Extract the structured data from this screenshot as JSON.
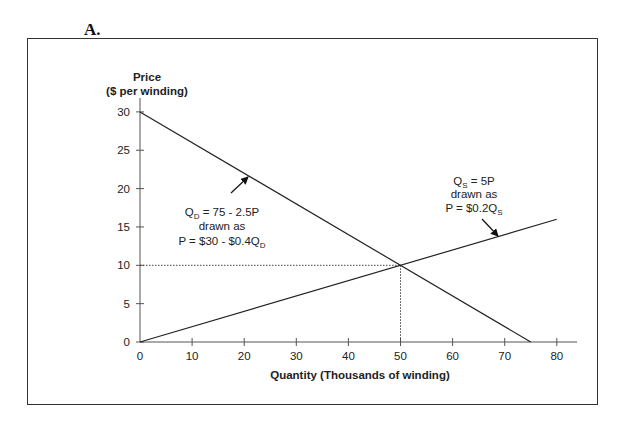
{
  "figure_label": "A.",
  "chart_data": {
    "type": "line",
    "title": "",
    "xlabel": "Quantity (Thousands of winding)",
    "ylabel_line1": "Price",
    "ylabel_line2": "($ per winding)",
    "xlim": [
      0,
      80
    ],
    "ylim": [
      0,
      30
    ],
    "x_ticks": [
      0,
      10,
      20,
      30,
      40,
      50,
      60,
      70,
      80
    ],
    "y_ticks": [
      0,
      5,
      10,
      15,
      20,
      25,
      30
    ],
    "grid": false,
    "legend": "none",
    "series": [
      {
        "name": "Demand",
        "equation": "QD = 75 - 2.5P",
        "drawn_as": "P = $30 - $0.4QD",
        "points": [
          [
            0,
            30
          ],
          [
            75,
            0
          ]
        ]
      },
      {
        "name": "Supply",
        "equation": "QS = 5P",
        "drawn_as": "P = $0.2QS",
        "points": [
          [
            0,
            0
          ],
          [
            80,
            16
          ]
        ]
      }
    ],
    "equilibrium": {
      "quantity": 50,
      "price": 10
    },
    "annotations": [
      {
        "target": "Demand",
        "lines": [
          "QD = 75 - 2.5P",
          "drawn as",
          "P = $30 - $0.4QD"
        ]
      },
      {
        "target": "Supply",
        "lines": [
          "QS = 5P",
          "drawn as",
          "P = $0.2QS"
        ]
      }
    ]
  },
  "labels": {
    "x_ticks": [
      "0",
      "10",
      "20",
      "30",
      "40",
      "50",
      "60",
      "70",
      "80"
    ],
    "y_ticks": [
      "0",
      "5",
      "10",
      "15",
      "20",
      "25",
      "30"
    ],
    "demand": {
      "l1_main": "Q",
      "l1_sub": "D",
      "l1_rest": " = 75 - 2.5P",
      "l2": "drawn as",
      "l3_main": "P = $30 - $0.4Q",
      "l3_sub": "D"
    },
    "supply": {
      "l1_main": "Q",
      "l1_sub": "S",
      "l1_rest": " = 5P",
      "l2": "drawn as",
      "l3_main": "P = $0.2Q",
      "l3_sub": "S"
    }
  }
}
